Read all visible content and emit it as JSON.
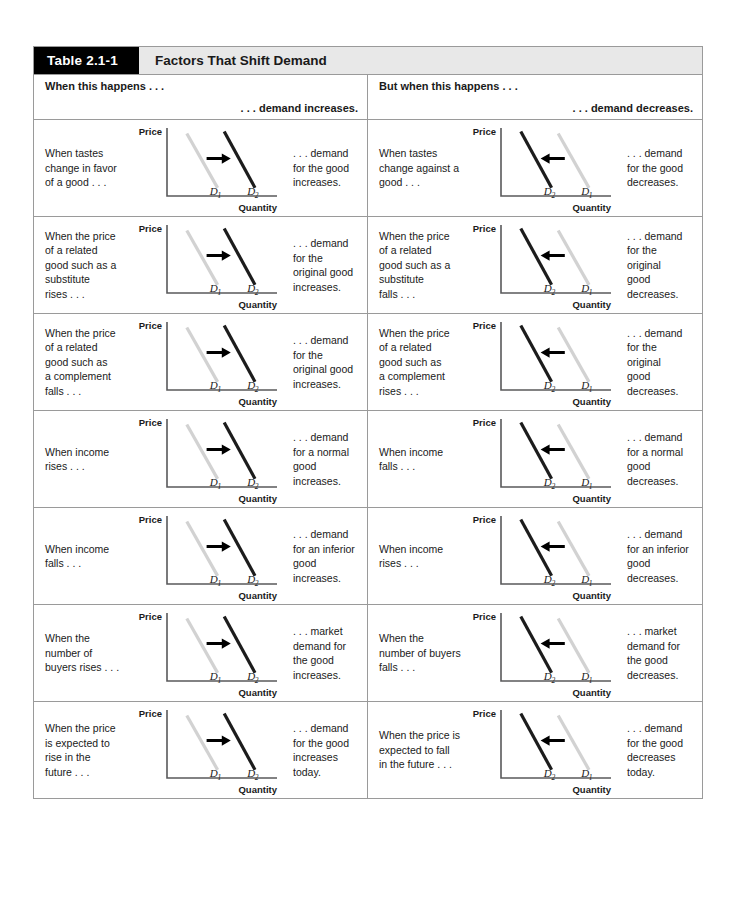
{
  "table": {
    "tag": "Table 2.1-1",
    "title": "Factors That Shift Demand",
    "headers": {
      "left_condition": "When this\nhappens . . .",
      "left_result": ". . . demand increases.",
      "right_condition": "But when this\nhappens . . .",
      "right_result": ". . . demand decreases."
    },
    "colors": {
      "curve_initial": "#d2d2d2",
      "curve_shifted": "#1c1c1c",
      "axis": "#59595b",
      "tag_background": "#000000",
      "title_background": "#e8e8e8",
      "border": "#9a9a9a"
    },
    "chart_labels": {
      "y_axis": "Price",
      "x_axis": "Quantity",
      "curve_1": "D",
      "curve_1_sub": "1",
      "curve_2": "D",
      "curve_2_sub": "2"
    },
    "rows": [
      {
        "left": {
          "condition": "When tastes\nchange in favor\nof a good . . .",
          "result": ". . . demand\nfor the good\nincreases.",
          "shift": "right"
        },
        "right": {
          "condition": "When tastes\nchange against a\ngood . . .",
          "result": ". . . demand\nfor the good\ndecreases.",
          "shift": "left"
        }
      },
      {
        "left": {
          "condition": "When the price\nof a related\ngood such as a\nsubstitute\nrises . . .",
          "result": ". . . demand\nfor the\noriginal good\nincreases.",
          "shift": "right"
        },
        "right": {
          "condition": "When the price\nof a related\ngood such as a\nsubstitute\nfalls . . .",
          "result": ". . . demand\nfor the\noriginal\ngood\ndecreases.",
          "shift": "left"
        }
      },
      {
        "left": {
          "condition": "When the price\nof a related\ngood such as\na complement\nfalls . . .",
          "result": ". . . demand\nfor the\noriginal good\nincreases.",
          "shift": "right"
        },
        "right": {
          "condition": "When the price\nof a related\ngood such as\na complement\nrises . . .",
          "result": ". . . demand\nfor the\noriginal\ngood\ndecreases.",
          "shift": "left"
        }
      },
      {
        "left": {
          "condition": "When income\nrises . . .",
          "result": ". . . demand\nfor a normal\ngood\nincreases.",
          "shift": "right"
        },
        "right": {
          "condition": "When income\nfalls . . .",
          "result": ". . . demand\nfor a normal\ngood\ndecreases.",
          "shift": "left"
        }
      },
      {
        "left": {
          "condition": "When income\nfalls . . .",
          "result": ". . . demand\nfor an inferior\ngood\nincreases.",
          "shift": "right"
        },
        "right": {
          "condition": "When income\nrises . . .",
          "result": ". . . demand\nfor an inferior\ngood\ndecreases.",
          "shift": "left"
        }
      },
      {
        "left": {
          "condition": "When the\nnumber of\nbuyers rises . . .",
          "result": ". . . market\ndemand for\nthe good\nincreases.",
          "shift": "right"
        },
        "right": {
          "condition": "When the\nnumber of buyers\nfalls . . .",
          "result": ". . . market\ndemand for\nthe good\ndecreases.",
          "shift": "left"
        }
      },
      {
        "left": {
          "condition": "When the price\nis expected to\nrise in the\nfuture . . .",
          "result": ". . . demand\nfor the good\nincreases\ntoday.",
          "shift": "right"
        },
        "right": {
          "condition": "When the price is\nexpected to fall\nin the future . . .",
          "result": ". . . demand\nfor the good\ndecreases\ntoday.",
          "shift": "left"
        }
      }
    ]
  },
  "chart_data": {
    "type": "line",
    "title": "Factors That Shift Demand",
    "xlabel": "Quantity",
    "ylabel": "Price",
    "series": [
      {
        "name": "D1",
        "role": "initial demand curve",
        "color": "#d2d2d2",
        "note": "light gray; drawn on the left when demand increases, on the right when demand decreases"
      },
      {
        "name": "D2",
        "role": "new demand curve after shift",
        "color": "#1c1c1c",
        "note": "dark; drawn on the right when demand increases, on the left when demand decreases"
      }
    ],
    "increase_curves": {
      "D1": {
        "x": [
          0.18,
          0.46
        ],
        "y": [
          0.92,
          0.12
        ]
      },
      "D2": {
        "x": [
          0.52,
          0.8
        ],
        "y": [
          0.95,
          0.12
        ]
      },
      "arrow": {
        "from_x": 0.36,
        "to_x": 0.58,
        "y": 0.55,
        "direction": "right"
      }
    },
    "decrease_curves": {
      "D2": {
        "x": [
          0.18,
          0.46
        ],
        "y": [
          0.95,
          0.12
        ]
      },
      "D1": {
        "x": [
          0.52,
          0.8
        ],
        "y": [
          0.92,
          0.12
        ]
      },
      "arrow": {
        "from_x": 0.58,
        "to_x": 0.36,
        "y": 0.55,
        "direction": "left"
      }
    },
    "axis_ranges": {
      "xlim": [
        0,
        1
      ],
      "ylim": [
        0,
        1
      ]
    },
    "grid": false,
    "legend": "none"
  }
}
